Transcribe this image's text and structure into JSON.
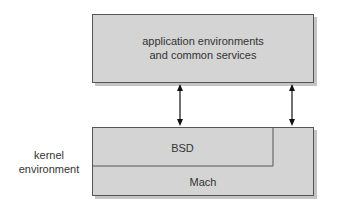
{
  "diagram": {
    "top_box": {
      "line1": "application environments",
      "line2": "and common services"
    },
    "kernel": {
      "side_label_line1": "kernel",
      "side_label_line2": "environment",
      "bsd_label": "BSD",
      "mach_label": "Mach"
    },
    "colors": {
      "box_fill": "#d4d4d4",
      "shadow": "#c4c4c4",
      "border": "#555555",
      "arrow": "#111111"
    }
  }
}
